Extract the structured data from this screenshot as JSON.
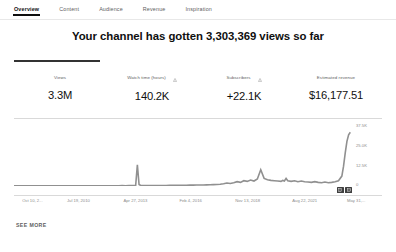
{
  "tabs": [
    {
      "label": "Overview",
      "active": true
    },
    {
      "label": "Content",
      "active": false
    },
    {
      "label": "Audience",
      "active": false
    },
    {
      "label": "Revenue",
      "active": false
    },
    {
      "label": "Inspiration",
      "active": false
    }
  ],
  "headline": "Your channel has gotten 3,303,369 views so far",
  "metrics": [
    {
      "label": "Views",
      "value": "3.3M",
      "warning": false,
      "active": true
    },
    {
      "label": "Watch time (hours)",
      "value": "140.2K",
      "warning": true,
      "active": false
    },
    {
      "label": "Subscribers",
      "value": "+22.1K",
      "warning": true,
      "active": false
    },
    {
      "label": "Estimated revenue",
      "value": "$16,177.51",
      "warning": false,
      "active": false
    }
  ],
  "chart_controls": [
    {
      "name": "chart-view-toggle-1"
    },
    {
      "name": "chart-view-toggle-2"
    }
  ],
  "see_more": "SEE MORE",
  "colors": {
    "line": "#909090",
    "axis_text": "#8d8d8d",
    "accent": "#0f0f0f",
    "rule": "#d9d9d9",
    "control": "#3f3f3f"
  },
  "chart_data": {
    "type": "line",
    "title": "",
    "xlabel": "",
    "ylabel": "",
    "grid": false,
    "legend": null,
    "ylim": [
      0,
      37500
    ],
    "yticks": [
      37500,
      25000,
      12500,
      0
    ],
    "ytick_labels": [
      "37.5K",
      "25.0K",
      "12.5K",
      "0"
    ],
    "xtick_labels": [
      "Oct 10, 2...",
      "Jul 19, 2010",
      "Apr 27, 2013",
      "Feb 4, 2016",
      "Nov 13, 2018",
      "Aug 22, 2021",
      "May 31,..."
    ],
    "xtick_positions_pct": [
      5,
      17.5,
      33,
      48,
      63.5,
      79,
      93
    ],
    "series": [
      {
        "name": "Views",
        "x_pct": [
          0,
          1,
          2,
          3,
          4,
          5,
          6,
          7,
          8,
          9,
          10,
          11,
          12,
          13,
          14,
          15,
          16,
          17,
          18,
          19,
          20,
          21,
          22,
          23,
          24,
          25,
          26,
          27,
          28,
          29,
          30,
          31,
          32,
          33,
          34,
          35,
          36,
          36.5,
          37,
          37.5,
          38,
          39,
          40,
          41,
          42,
          43,
          44,
          45,
          46,
          47,
          48,
          49,
          50,
          51,
          52,
          53,
          54,
          55,
          56,
          57,
          58,
          59,
          60,
          61,
          62,
          63,
          64,
          65,
          66,
          67,
          68,
          69,
          70,
          71,
          72,
          73,
          74,
          75,
          76,
          77,
          78,
          79,
          79.5,
          80,
          80.5,
          81,
          82,
          83,
          84,
          85,
          86,
          87,
          88,
          89,
          90,
          91,
          92,
          93,
          94,
          95,
          96,
          97,
          97.5,
          98,
          98.5,
          99,
          99.5,
          100
        ],
        "y": [
          120,
          100,
          140,
          110,
          90,
          130,
          100,
          120,
          110,
          140,
          100,
          130,
          110,
          90,
          120,
          100,
          140,
          110,
          130,
          100,
          120,
          150,
          110,
          130,
          120,
          160,
          140,
          120,
          150,
          130,
          170,
          150,
          200,
          180,
          220,
          260,
          400,
          12800,
          900,
          300,
          260,
          240,
          300,
          280,
          320,
          300,
          340,
          320,
          380,
          360,
          400,
          420,
          460,
          440,
          520,
          500,
          560,
          600,
          640,
          700,
          760,
          820,
          900,
          1100,
          1400,
          1800,
          1500,
          2000,
          2600,
          2200,
          3200,
          2800,
          3600,
          3000,
          4200,
          9800,
          4600,
          3800,
          3400,
          3200,
          3000,
          2800,
          3400,
          3000,
          4600,
          3200,
          2800,
          3200,
          2600,
          3000,
          2600,
          2400,
          2200,
          2600,
          2200,
          2000,
          2400,
          2000,
          2200,
          2600,
          3200,
          6000,
          12000,
          20000,
          27000,
          31000,
          32500
        ]
      }
    ]
  }
}
